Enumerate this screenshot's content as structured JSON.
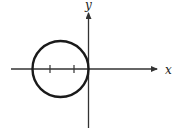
{
  "diagram": {
    "axes": {
      "x_label": "x",
      "y_label": "y",
      "color": "#333333"
    },
    "circle": {
      "center": {
        "x": 60,
        "y": 69
      },
      "radius": 28,
      "stroke": "#1a1a1a",
      "stroke_width": 2.4
    },
    "ticks": [
      {
        "x": 50,
        "y": 69
      },
      {
        "x": 74,
        "y": 69
      }
    ]
  }
}
